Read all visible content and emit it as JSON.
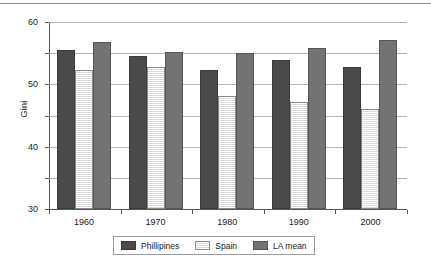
{
  "chart_data": {
    "type": "bar",
    "title": "",
    "xlabel": "",
    "ylabel": "Gini",
    "categories": [
      "1960",
      "1970",
      "1980",
      "1990",
      "2000"
    ],
    "series": [
      {
        "name": "Phillipines",
        "color": "#4a4a4a",
        "values": [
          51.0,
          49.0,
          44.6,
          47.8,
          45.6
        ]
      },
      {
        "name": "Spain",
        "color": "#ededed",
        "values": [
          44.5,
          45.6,
          36.3,
          34.4,
          32.1
        ]
      },
      {
        "name": "LA mean",
        "color": "#737373",
        "values": [
          53.5,
          50.4,
          50.2,
          51.6,
          54.2
        ]
      }
    ],
    "ylim": [
      0,
      60
    ],
    "yticks": [
      0,
      10,
      20,
      30,
      40,
      50,
      60
    ],
    "ytick_labels": [
      "0",
      "10",
      "20",
      "30",
      "40",
      "50",
      "60"
    ],
    "grid": true,
    "legend_position": "bottom"
  }
}
